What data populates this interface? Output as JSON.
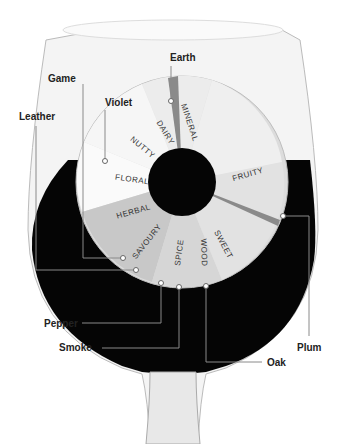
{
  "colors": {
    "wine": "#050505",
    "glass": "#f2f2f2",
    "leader": "#8a8a8a",
    "text": "#222222"
  },
  "categories": [
    {
      "label": "MINERAL",
      "angle": -8
    },
    {
      "label": "DAIRY",
      "angle": -28
    },
    {
      "label": "NUTTY",
      "angle": -50
    },
    {
      "label": "FLORAL",
      "angle": -82
    },
    {
      "label": "HERBAL",
      "angle": -108
    },
    {
      "label": "SAVOURY",
      "angle": -140
    },
    {
      "label": "SPICE",
      "angle": -172
    },
    {
      "label": "WOOD",
      "angle": 172
    },
    {
      "label": "SWEET",
      "angle": 148
    },
    {
      "label": "FRUITY",
      "angle": 78
    }
  ],
  "callouts": {
    "earth": "Earth",
    "game": "Game",
    "violet": "Violet",
    "leather": "Leather",
    "pepper": "Pepper",
    "smoke": "Smoke",
    "oak": "Oak",
    "plum": "Plum"
  }
}
